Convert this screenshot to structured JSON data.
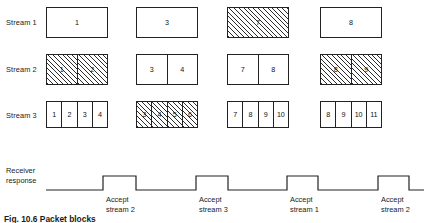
{
  "figure": {
    "caption": "Fig. 10.6   Packet blocks",
    "rows": [
      {
        "label": "Stream 1",
        "label_x": 6,
        "label_y": 18,
        "box_top": 7,
        "box_height": 31,
        "groups": [
          {
            "x": 46,
            "width": 62,
            "hatched": false,
            "cells": [
              "1"
            ]
          },
          {
            "x": 136,
            "width": 62,
            "hatched": false,
            "cells": [
              "3"
            ]
          },
          {
            "x": 227,
            "width": 62,
            "hatched": true,
            "cells": [
              "7"
            ]
          },
          {
            "x": 320,
            "width": 62,
            "hatched": false,
            "cells": [
              "8"
            ]
          }
        ]
      },
      {
        "label": "Stream 2",
        "label_x": 6,
        "label_y": 65,
        "box_top": 54,
        "box_height": 31,
        "groups": [
          {
            "x": 46,
            "width": 62,
            "hatched": true,
            "cells": [
              "1",
              "2"
            ]
          },
          {
            "x": 136,
            "width": 62,
            "hatched": false,
            "cells": [
              "3",
              "4"
            ]
          },
          {
            "x": 227,
            "width": 62,
            "hatched": false,
            "cells": [
              "7",
              "8"
            ]
          },
          {
            "x": 320,
            "width": 62,
            "hatched": true,
            "cells": [
              "8",
              "9"
            ]
          }
        ]
      },
      {
        "label": "Stream 3",
        "label_x": 6,
        "label_y": 111,
        "box_top": 101,
        "box_height": 27,
        "groups": [
          {
            "x": 46,
            "width": 62,
            "hatched": false,
            "cells": [
              "1",
              "2",
              "3",
              "4"
            ]
          },
          {
            "x": 136,
            "width": 62,
            "hatched": true,
            "cells": [
              "3",
              "4",
              "5",
              "6"
            ]
          },
          {
            "x": 227,
            "width": 62,
            "hatched": false,
            "cells": [
              "7",
              "8",
              "9",
              "10"
            ]
          },
          {
            "x": 320,
            "width": 62,
            "hatched": false,
            "cells": [
              "8",
              "9",
              "10",
              "11"
            ]
          }
        ]
      }
    ],
    "receiver": {
      "label_line1": "Receiver",
      "label_line2": "response",
      "baseline_y": 190,
      "high_y": 176,
      "start_x": 46,
      "end_x": 424,
      "pulses": [
        {
          "rise_x": 103,
          "fall_x": 136,
          "label_line1": "Accept",
          "label_line2": "stream 2",
          "label_x": 106
        },
        {
          "rise_x": 196,
          "fall_x": 228,
          "label_line1": "Accept",
          "label_line2": "stream 3",
          "label_x": 199
        },
        {
          "rise_x": 287,
          "fall_x": 318,
          "label_line1": "Accept",
          "label_line2": "stream 1",
          "label_x": 290
        },
        {
          "rise_x": 378,
          "fall_x": 409,
          "label_line1": "Accept",
          "label_line2": "stream 2",
          "label_x": 381
        }
      ]
    },
    "colors": {
      "ink": "#1a1a1a",
      "stroke": "#222222",
      "hatch": "#2b2b2b",
      "background": "#ffffff"
    }
  }
}
